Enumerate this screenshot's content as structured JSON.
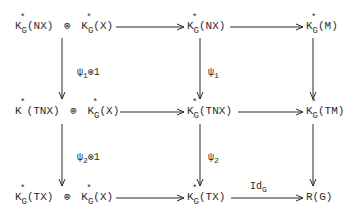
{
  "diagram": {
    "type": "commutative-diagram",
    "nodes": {
      "r0c0": {
        "k": "K",
        "sup": "*",
        "sub": "G",
        "arg": "(NX)",
        "tensor": "⊗",
        "k2": "K",
        "sup2": "*",
        "sub2": "G",
        "arg2": "(X)"
      },
      "r0c1": {
        "k": "K",
        "sup": "*",
        "sub": "G",
        "arg": "(NX)"
      },
      "r0c2": {
        "k": "K",
        "sup": "*",
        "sub": "G",
        "arg": "(M)"
      },
      "r1c0": {
        "k": "K",
        "sup": "*",
        "sub": "",
        "arg": "(TNX)",
        "tensor": "⊗",
        "k2": "K",
        "sup2": "*",
        "sub2": "G",
        "arg2": "(X)"
      },
      "r1c1": {
        "k": "K",
        "sup": "*",
        "sub": "G",
        "arg": "(TNX)"
      },
      "r1c2": {
        "k": "K",
        "sup": "*",
        "sub": "G",
        "arg": "(TM)"
      },
      "r2c0": {
        "k": "K",
        "sup": "*",
        "sub": "G",
        "arg": "(TX)",
        "tensor": "⊗",
        "k2": "K",
        "sup2": "*",
        "sub2": "G",
        "arg2": "(X)"
      },
      "r2c1": {
        "k": "K",
        "sup": "*",
        "sub": "G",
        "arg": "(TX)"
      },
      "r2c2": {
        "text": "R(G)"
      }
    },
    "arrow_labels": {
      "psi1_tensor_1": {
        "sym": "ψ",
        "sub": "1",
        "rest": "⊗1"
      },
      "psi1": {
        "sym": "ψ",
        "sub": "1"
      },
      "psi2_tensor_1": {
        "sym": "ψ",
        "sub": "2",
        "rest": "⊗1"
      },
      "psi2": {
        "sym": "ψ",
        "sub": "2"
      },
      "id_g": {
        "sym": "Id",
        "sub": "G"
      }
    },
    "colors": {
      "ink": "#2a2a2a",
      "background": "#ffffff"
    }
  }
}
